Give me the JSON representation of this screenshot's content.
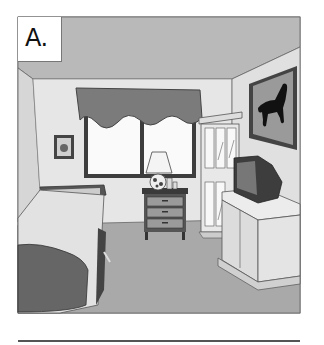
{
  "figure": {
    "label": "A.",
    "objects": [
      "window",
      "curtain valance",
      "small picture",
      "lamp",
      "nightstand",
      "glass cabinet",
      "horse picture",
      "television",
      "tv stand",
      "bed",
      "rug/floor"
    ]
  },
  "colors": {
    "ceiling": "#b9b9b9",
    "wall": "#e4e4e4",
    "floor": "#a8a8a8",
    "curtain": "#7a7a7a",
    "dark": "#3a3a3a",
    "outline": "#444444"
  },
  "answer_line": ""
}
